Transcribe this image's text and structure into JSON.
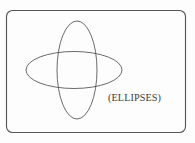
{
  "figure": {
    "name": "two-overlapping-ellipses-figure",
    "background_color": "#fdfdfd",
    "width": 195,
    "height": 143,
    "frame": {
      "name": "rounded-rectangle-border",
      "x": 6.5,
      "y": 10.5,
      "width": 179,
      "height": 122,
      "corner_radius": 6,
      "stroke_color": "#58585a",
      "stroke_width": 1.15
    },
    "shapes": [
      {
        "name": "horizontal-ellipse",
        "orientation": "horizontal",
        "center_x": 74,
        "center_y": 70,
        "radius_x": 48,
        "radius_y": 18.5,
        "stroke_color": "#4f5053",
        "stroke_width": 0.85,
        "fill": "none"
      },
      {
        "name": "vertical-ellipse",
        "orientation": "vertical",
        "center_x": 77,
        "center_y": 70,
        "radius_x": 20,
        "radius_y": 49,
        "stroke_color": "#4f5053",
        "stroke_width": 0.85,
        "fill": "none"
      }
    ],
    "label": {
      "name": "ellipses-caption",
      "text": "(ELLIPSES)",
      "x": 108,
      "y": 101,
      "font_size": 10.2,
      "color": "#3b3b3d"
    }
  }
}
